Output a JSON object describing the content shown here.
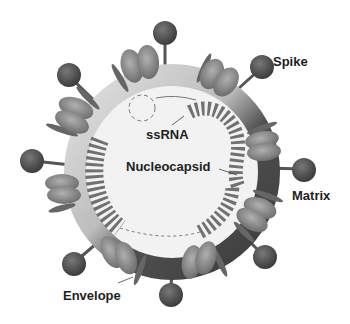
{
  "diagram": {
    "labels": {
      "spike": "Spike",
      "matrix": "Matrix",
      "ssrna": "ssRNA",
      "nucleocapsid": "Nucleocapsid",
      "envelope": "Envelope"
    },
    "colors": {
      "background": "#ffffff",
      "matrix_ring": "#4a4a4a",
      "envelope_light": "#c8c8c8",
      "interior": "#f0f0f0",
      "spike_head": "#555555",
      "protein_ellipse": "#8a8a8a",
      "rna_bead": "#5a5a5a",
      "label_text": "#1e1e1e"
    }
  }
}
